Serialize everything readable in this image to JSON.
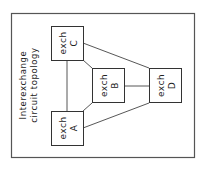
{
  "diagram": {
    "title_line1": "Interexchange",
    "title_line2": "circuit topology",
    "nodes": [
      {
        "id": "A",
        "line1": "exch",
        "line2": "A"
      },
      {
        "id": "B",
        "line1": "exch",
        "line2": "B"
      },
      {
        "id": "C",
        "line1": "exch",
        "line2": "C"
      },
      {
        "id": "D",
        "line1": "exch",
        "line2": "D"
      }
    ],
    "links": [
      [
        "A",
        "C"
      ],
      [
        "A",
        "B"
      ],
      [
        "A",
        "D"
      ],
      [
        "C",
        "B"
      ],
      [
        "C",
        "D"
      ],
      [
        "B",
        "D"
      ]
    ],
    "colors": {
      "line": "#444444",
      "frame": "#555555",
      "background": "#ffffff"
    }
  }
}
